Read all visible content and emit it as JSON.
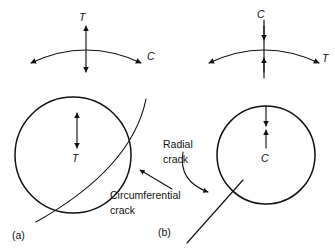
{
  "figure": {
    "panels": [
      {
        "id": "a",
        "label": "(a)",
        "stress_diagram": {
          "vertical_label": "T",
          "arc_label": "C",
          "vertical_sense": "outward",
          "arc_sense": "outward"
        },
        "circle": {
          "interior_label": "T",
          "interior_arrow_sense": "outward"
        },
        "crack": {
          "label_line1": "Circumferential",
          "label_line2": "crack",
          "type": "circumferential"
        }
      },
      {
        "id": "b",
        "label": "(b)",
        "stress_diagram": {
          "vertical_label": "C",
          "arc_label": "T",
          "vertical_sense": "inward",
          "arc_sense": "outward"
        },
        "circle": {
          "interior_label": "C",
          "interior_arrow_sense": "inward"
        },
        "crack": {
          "label_line1": "Radial",
          "label_line2": "crack",
          "type": "radial"
        }
      }
    ],
    "colors": {
      "ink": "#111111",
      "background": "#ffffff"
    }
  }
}
